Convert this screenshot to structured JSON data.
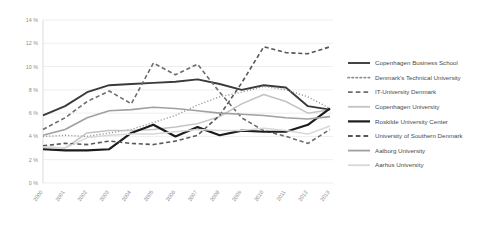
{
  "chart_data": {
    "type": "line",
    "title": "",
    "xlabel": "",
    "ylabel": "",
    "ylim": [
      0,
      14
    ],
    "ytick_labels": [
      "0 %",
      "2 %",
      "4 %",
      "6 %",
      "8 %",
      "10 %",
      "12 %",
      "14 %"
    ],
    "ytick_values": [
      0,
      2,
      4,
      6,
      8,
      10,
      12,
      14
    ],
    "grid": true,
    "legend_position": "right",
    "x": [
      "2000",
      "2001",
      "2002",
      "2003",
      "2004",
      "2005",
      "2006",
      "2007",
      "2008",
      "2009",
      "2010",
      "2011",
      "2012",
      "2013"
    ],
    "series": [
      {
        "name": "Copenhagen Business School",
        "style": "solid",
        "color": "#3a3a3a",
        "width": 1.9,
        "values": [
          5.8,
          6.6,
          7.8,
          8.4,
          8.5,
          8.6,
          8.7,
          8.9,
          8.5,
          8.0,
          8.4,
          8.2,
          6.6,
          6.3
        ]
      },
      {
        "name": "Denmark's Technical University",
        "style": "dotted",
        "color": "#8f8f8f",
        "width": 1.4,
        "values": [
          4.0,
          4.1,
          4.0,
          4.3,
          4.6,
          5.2,
          5.8,
          6.7,
          7.4,
          7.8,
          8.3,
          8.0,
          7.4,
          6.4
        ]
      },
      {
        "name": "IT-University Denmark",
        "style": "dashed",
        "color": "#6d6d6d",
        "width": 1.6,
        "values": [
          4.6,
          5.6,
          7.0,
          7.9,
          6.8,
          10.3,
          9.3,
          10.2,
          7.8,
          5.6,
          4.5,
          4.0,
          3.4,
          4.6
        ]
      },
      {
        "name": "Copenhagen University",
        "style": "solid",
        "color": "#c3c3c3",
        "width": 1.5,
        "values": [
          3.1,
          3.0,
          4.3,
          4.5,
          4.5,
          4.6,
          4.8,
          5.1,
          5.7,
          6.8,
          7.6,
          7.0,
          6.0,
          6.3
        ]
      },
      {
        "name": "Roskilde University Center",
        "style": "solid",
        "color": "#1c1c1c",
        "width": 2.2,
        "values": [
          2.9,
          2.8,
          2.8,
          2.9,
          4.3,
          5.0,
          4.0,
          4.8,
          4.1,
          4.5,
          4.4,
          4.4,
          5.0,
          6.4
        ]
      },
      {
        "name": "University of Southern Denmark",
        "style": "dashed",
        "color": "#575757",
        "width": 1.6,
        "values": [
          3.2,
          3.4,
          3.3,
          3.6,
          3.4,
          3.3,
          3.6,
          4.1,
          5.8,
          8.6,
          11.7,
          11.2,
          11.1,
          11.7
        ]
      },
      {
        "name": "Aalborg University",
        "style": "solid",
        "color": "#a0a0a0",
        "width": 1.6,
        "values": [
          4.1,
          4.6,
          5.6,
          6.2,
          6.3,
          6.5,
          6.4,
          6.2,
          6.0,
          5.9,
          5.8,
          5.6,
          5.5,
          5.7
        ]
      },
      {
        "name": "Aarhus University",
        "style": "solid",
        "color": "#d8d8d8",
        "width": 1.5,
        "values": [
          3.1,
          3.0,
          3.9,
          4.1,
          4.2,
          4.2,
          4.4,
          4.6,
          4.5,
          4.5,
          4.7,
          4.5,
          4.2,
          4.9
        ]
      }
    ]
  },
  "legend": {
    "items": [
      "Copenhagen Business School",
      "Denmark's Technical University",
      "IT-University Denmark",
      "Copenhagen University",
      "Roskilde University Center",
      "University of Southern Denmark",
      "Aalborg University",
      "Aarhus University"
    ]
  }
}
